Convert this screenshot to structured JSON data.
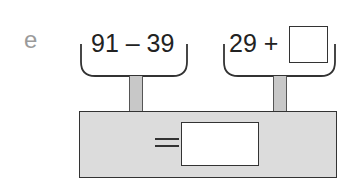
{
  "problem": {
    "label": "e",
    "left_expression": "91 – 39",
    "right_expression": "29 +",
    "right_blank": "",
    "equals_sign": "=",
    "answer_blank": ""
  },
  "colors": {
    "label": "#9a9a9a",
    "text": "#222222",
    "base_fill": "#dcdcdc",
    "post_fill": "#c8c8c8",
    "outline": "#333333"
  }
}
